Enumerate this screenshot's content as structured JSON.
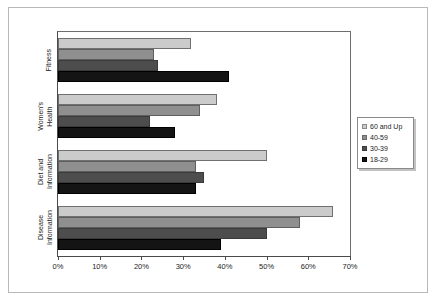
{
  "chart_data": {
    "type": "bar",
    "orientation": "horizontal",
    "title": "",
    "xlabel": "",
    "ylabel": "",
    "categories": [
      "Fitness",
      "Women's Health",
      "Diet and Information",
      "Disease Information"
    ],
    "series": [
      {
        "name": "60 and Up",
        "color": "#cbcbcb",
        "values": [
          32,
          38,
          50,
          66
        ]
      },
      {
        "name": "40-59",
        "color": "#8f8f8f",
        "values": [
          23,
          34,
          33,
          58
        ]
      },
      {
        "name": "30-39",
        "color": "#4d4d4d",
        "values": [
          24,
          22,
          35,
          50
        ]
      },
      {
        "name": "18-29",
        "color": "#141414",
        "values": [
          41,
          28,
          33,
          39
        ]
      }
    ],
    "xlim": [
      0,
      70
    ],
    "xticks": [
      0,
      10,
      20,
      30,
      40,
      50,
      60,
      70
    ],
    "xtick_labels": [
      "0%",
      "10%",
      "20%",
      "30%",
      "40%",
      "50%",
      "60%",
      "70%"
    ],
    "grid": false,
    "legend_position": "right"
  },
  "legend": {
    "entries": [
      {
        "label": "60 and Up"
      },
      {
        "label": "40-59"
      },
      {
        "label": "30-39"
      },
      {
        "label": "18-29"
      }
    ]
  },
  "axis": {
    "categories": [
      {
        "label": "Fitness"
      },
      {
        "label": "Women's\nHealth"
      },
      {
        "label": "Diet and\nInformation"
      },
      {
        "label": "Disease\nInformation"
      }
    ],
    "xtick_labels": [
      "0%",
      "10%",
      "20%",
      "30%",
      "40%",
      "50%",
      "60%",
      "70%"
    ]
  }
}
